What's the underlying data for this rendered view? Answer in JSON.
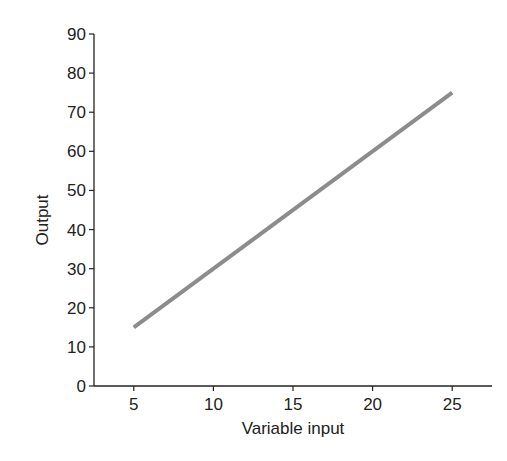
{
  "chart_data": {
    "type": "line",
    "title": "",
    "xlabel": "Variable input",
    "ylabel": "Output",
    "xlim": [
      2.5,
      27.5
    ],
    "ylim": [
      0,
      90
    ],
    "x_ticks": [
      5,
      10,
      15,
      20,
      25
    ],
    "y_ticks": [
      0,
      10,
      20,
      30,
      40,
      50,
      60,
      70,
      80,
      90
    ],
    "grid": false,
    "legend": null,
    "series": [
      {
        "name": "Output",
        "x": [
          5,
          25
        ],
        "y": [
          15,
          75
        ],
        "color": "#8c8c8c"
      }
    ]
  },
  "colors": {
    "axis": "#222222",
    "line": "#8c8c8c",
    "background": "#ffffff"
  }
}
